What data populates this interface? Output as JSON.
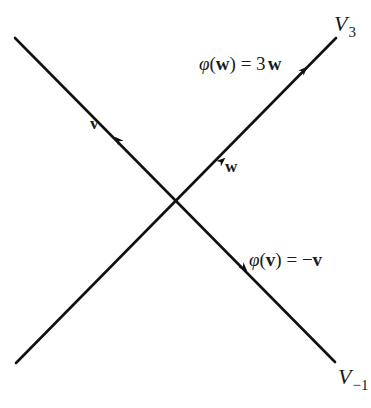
{
  "diagram": {
    "lines": [
      {
        "id": "V3",
        "label": "V",
        "subscript": "3",
        "from": [
          16,
          363
        ],
        "to": [
          336,
          38
        ]
      },
      {
        "id": "V-1",
        "label": "V",
        "subscript": "−1",
        "from": [
          15,
          38
        ],
        "to": [
          335,
          362
        ]
      }
    ],
    "vectors": {
      "v": {
        "label": "v"
      },
      "w": {
        "label": "w"
      }
    },
    "equations": {
      "phi_w": {
        "phi": "φ",
        "open": "(",
        "arg": "w",
        "close": ")",
        "eq": " = 3",
        "rhs": "w"
      },
      "phi_v": {
        "phi": "φ",
        "open": "(",
        "arg": "v",
        "close": ")",
        "eq": " = −",
        "rhs": "v"
      }
    },
    "colors": {
      "line": "#111111",
      "text": "#1a1a1a",
      "background": "#ffffff"
    }
  }
}
